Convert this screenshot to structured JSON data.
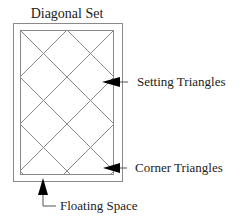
{
  "title": "Diagonal Set",
  "labels": {
    "setting": "Setting Triangles",
    "corner": "Corner Triangles",
    "floating": "Floating Space"
  },
  "colors": {
    "line": "#8a8a8a",
    "text": "#222222",
    "arrow": "#000000"
  }
}
